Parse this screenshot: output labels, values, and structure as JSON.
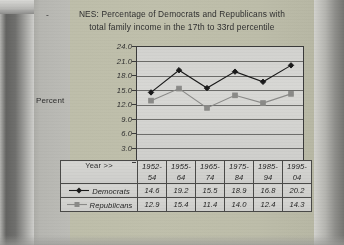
{
  "title": {
    "bullet": "-",
    "line1": "NES:  Percentage of Democrats and Republicans with",
    "line2": "total family income in the 17th to 33rd percentile"
  },
  "axis": {
    "y_label": "Percent",
    "year_label": "Year >>"
  },
  "colors": {
    "democrats": "#1a1a1a",
    "republicans": "#8a8a88",
    "axis": "#3b3b3b",
    "grid": "#5a5a58",
    "plot_bg": "#d4d4d1",
    "page_bg": "#d8d8d5"
  },
  "chart_data": {
    "type": "line",
    "title": "NES:  Percentage of Democrats and Republicans with total family income in the 17th to 33rd percentile",
    "xlabel": "Year >>",
    "ylabel": "Percent",
    "categories": [
      "1952-54",
      "1955-64",
      "1965-74",
      "1975-84",
      "1985-94",
      "1995-04"
    ],
    "series": [
      {
        "name": "Democrats",
        "values": [
          14.6,
          19.2,
          15.5,
          18.9,
          16.8,
          20.2
        ],
        "marker": "diamond",
        "color": "#1a1a1a"
      },
      {
        "name": "Republicans",
        "values": [
          12.9,
          15.4,
          11.4,
          14.0,
          12.4,
          14.3
        ],
        "marker": "square",
        "color": "#8a8a88"
      }
    ],
    "ylim": [
      0.0,
      24.0
    ],
    "yticks": [
      "24.0",
      "21.0",
      "18.0",
      "15.0",
      "12.0",
      "9.0",
      "6.0",
      "3.0",
      "0.0"
    ],
    "grid": true,
    "legend_position": "data-table-left"
  }
}
